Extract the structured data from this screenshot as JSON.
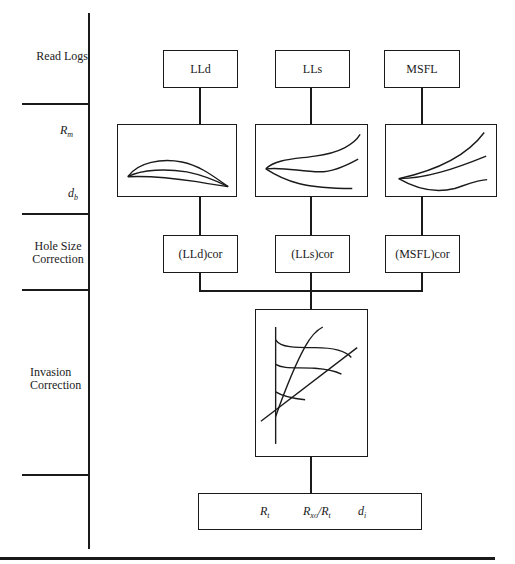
{
  "rows": [
    {
      "label_lines": [
        "Read Logs"
      ]
    },
    {
      "label_top": "R",
      "label_top_sub": "m",
      "label_bottom": "d",
      "label_bottom_sub": "b"
    },
    {
      "label_lines": [
        "Hole Size",
        "Correction"
      ]
    },
    {
      "label_lines": [
        "Invasion",
        "Correction"
      ]
    }
  ],
  "logs": [
    {
      "name": "LLd",
      "corrected": "(LLd)cor"
    },
    {
      "name": "LLs",
      "corrected": "(LLs)cor"
    },
    {
      "name": "MSFL",
      "corrected": "(MSFL)cor"
    }
  ],
  "result": {
    "rt": {
      "base": "R",
      "sub": "t"
    },
    "ratio": {
      "base": "R",
      "sub": "xo",
      "sep": "/",
      "base2": "R",
      "sub2": "t"
    },
    "di": {
      "base": "d",
      "sub": "i"
    }
  },
  "colors": {
    "ink": "#1a1a1a",
    "background": "#ffffff"
  }
}
